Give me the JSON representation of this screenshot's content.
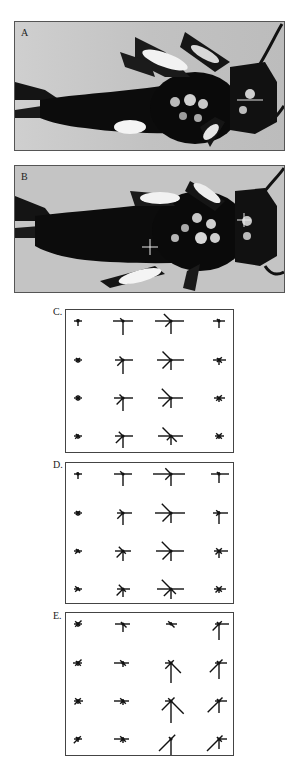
{
  "figure": {
    "panels": [
      {
        "id": "A",
        "label": "A",
        "type": "photograph",
        "subject": "insect-larva-dorsal-view",
        "crosshairs": []
      },
      {
        "id": "B",
        "label": "B",
        "type": "photograph",
        "subject": "insect-larva-dorsal-view",
        "crosshairs": [
          {
            "x": 149,
            "y": 246
          },
          {
            "x": 243,
            "y": 219
          }
        ]
      },
      {
        "id": "C",
        "label": "C.",
        "type": "vector-star-grid"
      },
      {
        "id": "D",
        "label": "D.",
        "type": "vector-star-grid"
      },
      {
        "id": "E",
        "label": "E.",
        "type": "vector-star-grid"
      }
    ]
  },
  "chart_data": [
    {
      "type": "vector-star-grid",
      "panel": "C",
      "title": "C.",
      "rows": 4,
      "cols": 4,
      "ray_directions_deg": [
        0,
        45,
        90,
        135,
        180,
        225,
        270,
        315
      ],
      "ray_lengths": [
        [
          [
            4,
            2,
            2,
            2,
            4,
            0,
            5,
            0
          ],
          [
            10,
            0,
            0,
            4,
            10,
            0,
            14,
            0
          ],
          [
            13,
            0,
            0,
            10,
            16,
            8,
            13,
            0
          ],
          [
            6,
            0,
            2,
            3,
            6,
            0,
            7,
            0
          ]
        ],
        [
          [
            4,
            3,
            2,
            3,
            4,
            3,
            3,
            3
          ],
          [
            10,
            0,
            0,
            5,
            8,
            8,
            14,
            0
          ],
          [
            13,
            0,
            0,
            12,
            14,
            12,
            10,
            0
          ],
          [
            7,
            4,
            2,
            3,
            6,
            3,
            5,
            4
          ]
        ],
        [
          [
            4,
            3,
            3,
            3,
            4,
            3,
            3,
            3
          ],
          [
            10,
            0,
            0,
            5,
            9,
            9,
            13,
            0
          ],
          [
            12,
            0,
            0,
            13,
            13,
            12,
            10,
            0
          ],
          [
            6,
            4,
            0,
            3,
            5,
            4,
            4,
            4
          ]
        ],
        [
          [
            4,
            0,
            2,
            3,
            4,
            4,
            3,
            3
          ],
          [
            10,
            0,
            0,
            6,
            8,
            10,
            12,
            0
          ],
          [
            12,
            0,
            0,
            12,
            13,
            6,
            9,
            8
          ],
          [
            5,
            4,
            0,
            4,
            4,
            4,
            3,
            4
          ]
        ]
      ]
    },
    {
      "type": "vector-star-grid",
      "panel": "D",
      "title": "D.",
      "rows": 4,
      "cols": 4,
      "ray_lengths": [
        [
          [
            4,
            0,
            2,
            2,
            4,
            0,
            5,
            0
          ],
          [
            9,
            0,
            0,
            4,
            9,
            0,
            12,
            0
          ],
          [
            14,
            0,
            0,
            8,
            18,
            8,
            12,
            0
          ],
          [
            10,
            0,
            2,
            3,
            8,
            0,
            9,
            0
          ]
        ],
        [
          [
            4,
            3,
            2,
            3,
            4,
            3,
            3,
            3
          ],
          [
            9,
            0,
            0,
            5,
            6,
            8,
            12,
            0
          ],
          [
            14,
            0,
            0,
            13,
            16,
            12,
            10,
            0
          ],
          [
            9,
            0,
            2,
            4,
            6,
            4,
            11,
            0
          ]
        ],
        [
          [
            4,
            0,
            2,
            3,
            4,
            4,
            0,
            3
          ],
          [
            8,
            0,
            0,
            6,
            8,
            9,
            10,
            4
          ],
          [
            13,
            0,
            0,
            13,
            15,
            12,
            10,
            0
          ],
          [
            9,
            4,
            0,
            4,
            5,
            5,
            7,
            4
          ]
        ],
        [
          [
            4,
            0,
            2,
            4,
            4,
            4,
            0,
            3
          ],
          [
            7,
            0,
            0,
            6,
            6,
            9,
            8,
            4
          ],
          [
            13,
            0,
            0,
            13,
            14,
            10,
            10,
            7
          ],
          [
            7,
            4,
            0,
            4,
            5,
            5,
            4,
            4
          ]
        ]
      ]
    },
    {
      "type": "vector-star-grid",
      "panel": "E",
      "title": "E.",
      "rows": 4,
      "cols": 4,
      "ray_lengths": [
        [
          [
            4,
            5,
            2,
            4,
            4,
            4,
            3,
            3
          ],
          [
            7,
            0,
            0,
            3,
            8,
            0,
            8,
            5
          ],
          [
            6,
            0,
            2,
            4,
            5,
            0,
            0,
            5
          ],
          [
            10,
            4,
            0,
            3,
            4,
            9,
            16,
            0
          ]
        ],
        [
          [
            4,
            5,
            2,
            3,
            5,
            4,
            3,
            4
          ],
          [
            6,
            0,
            2,
            4,
            9,
            0,
            4,
            4
          ],
          [
            0,
            4,
            0,
            4,
            6,
            8,
            20,
            14
          ],
          [
            8,
            5,
            0,
            3,
            4,
            13,
            16,
            0
          ]
        ],
        [
          [
            5,
            4,
            2,
            4,
            4,
            5,
            3,
            4
          ],
          [
            6,
            0,
            2,
            4,
            9,
            4,
            4,
            4
          ],
          [
            0,
            5,
            0,
            4,
            6,
            13,
            22,
            18
          ],
          [
            8,
            5,
            0,
            3,
            4,
            16,
            12,
            0
          ]
        ],
        [
          [
            4,
            4,
            2,
            3,
            4,
            6,
            3,
            0
          ],
          [
            6,
            0,
            2,
            4,
            9,
            4,
            4,
            4
          ],
          [
            0,
            6,
            0,
            3,
            0,
            17,
            17,
            0
          ],
          [
            8,
            5,
            0,
            3,
            0,
            17,
            10,
            4
          ]
        ]
      ]
    }
  ]
}
